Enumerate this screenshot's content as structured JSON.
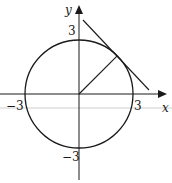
{
  "diagram": {
    "type": "circle-with-tangent",
    "axes": {
      "x_label": "x",
      "y_label": "y"
    },
    "tick_labels": {
      "x_pos": "3",
      "x_neg": "−3",
      "y_pos": "3",
      "y_neg": "−3"
    },
    "circle": {
      "center": [
        0,
        0
      ],
      "radius": 3
    },
    "radius_segment": {
      "from": [
        0,
        0
      ],
      "to_angle_deg": 45
    },
    "tangent_line": {
      "touches_circle_at_angle_deg": 45
    },
    "colors": {
      "stroke": "#1a1a1a",
      "artifact_line": "#c8c8c8"
    }
  }
}
